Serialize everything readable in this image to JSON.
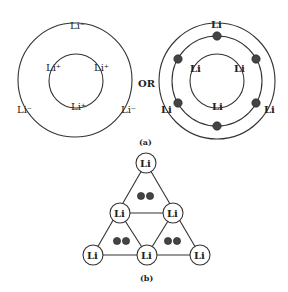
{
  "figure_a": {
    "caption": "(a)",
    "separator": "OR",
    "ionic_model": {
      "outer_ring_labels": [
        "Li⁻",
        "Li⁻",
        "Li⁻"
      ],
      "inner_ring_labels": [
        "Li⁺",
        "Li⁺",
        "Li⁺"
      ]
    },
    "covalent_model": {
      "outer_ring_labels": [
        "Li",
        "Li",
        "Li"
      ],
      "inner_ring_labels": [
        "Li",
        "Li",
        "Li"
      ],
      "electron_dot_count": 6
    }
  },
  "figure_b": {
    "caption": "(b)",
    "atoms": [
      {
        "label": "Li",
        "position": "top"
      },
      {
        "label": "Li",
        "position": "middle-left"
      },
      {
        "label": "Li",
        "position": "middle-right"
      },
      {
        "label": "Li",
        "position": "bottom-left"
      },
      {
        "label": "Li",
        "position": "bottom-center"
      },
      {
        "label": "Li",
        "position": "bottom-right"
      }
    ],
    "electron_pairs": 3
  },
  "colors": {
    "line": "#333333",
    "dot": "#444444",
    "background": "#ffffff"
  }
}
